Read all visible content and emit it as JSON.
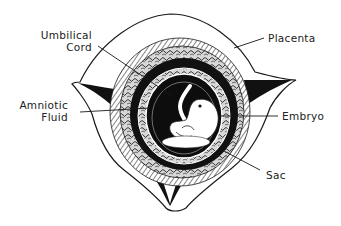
{
  "diagram": {
    "labels": {
      "umbilical_cord_line1": "Umbilical",
      "umbilical_cord_line2": "Cord",
      "placenta": "Placenta",
      "amniotic_fluid_line1": "Amniotic",
      "amniotic_fluid_line2": "Fluid",
      "embryo": "Embryo",
      "sac": "Sac"
    },
    "colors": {
      "ink": "#1a1a1a",
      "paper": "#ffffff",
      "hatch": "#555555"
    }
  }
}
